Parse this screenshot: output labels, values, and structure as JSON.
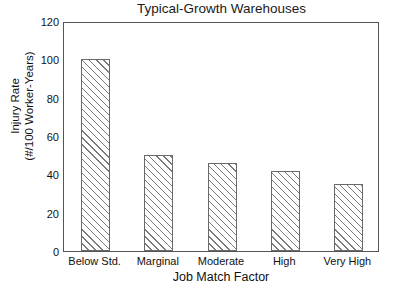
{
  "chart_data": {
    "type": "bar",
    "title": "Typical-Growth Warehouses",
    "xlabel": "Job Match Factor",
    "ylabel": "Injury Rate",
    "ylabel_line2": "(#/100 Worker-Years)",
    "categories": [
      "Below Std.",
      "Marginal",
      "Moderate",
      "High",
      "Very High"
    ],
    "values": [
      100,
      50,
      46,
      42,
      35
    ],
    "ylim": [
      0,
      120
    ],
    "ytick_values": [
      0,
      20,
      40,
      60,
      80,
      100,
      120
    ],
    "ytick_labels": [
      "0",
      "20",
      "40",
      "60",
      "80",
      "100",
      "120"
    ],
    "grid": false,
    "legend": null,
    "series": [
      {
        "name": "Injury Rate",
        "values": [
          100,
          50,
          46,
          42,
          35
        ]
      }
    ],
    "style": {
      "bar_fill": "#ffffff",
      "bar_hatch": "/",
      "bar_edge_color": "#6a6a6a",
      "hatch_color": "#7a7a7a",
      "frame_color": "#555555",
      "text_color": "#111111",
      "background": "#ffffff"
    }
  }
}
